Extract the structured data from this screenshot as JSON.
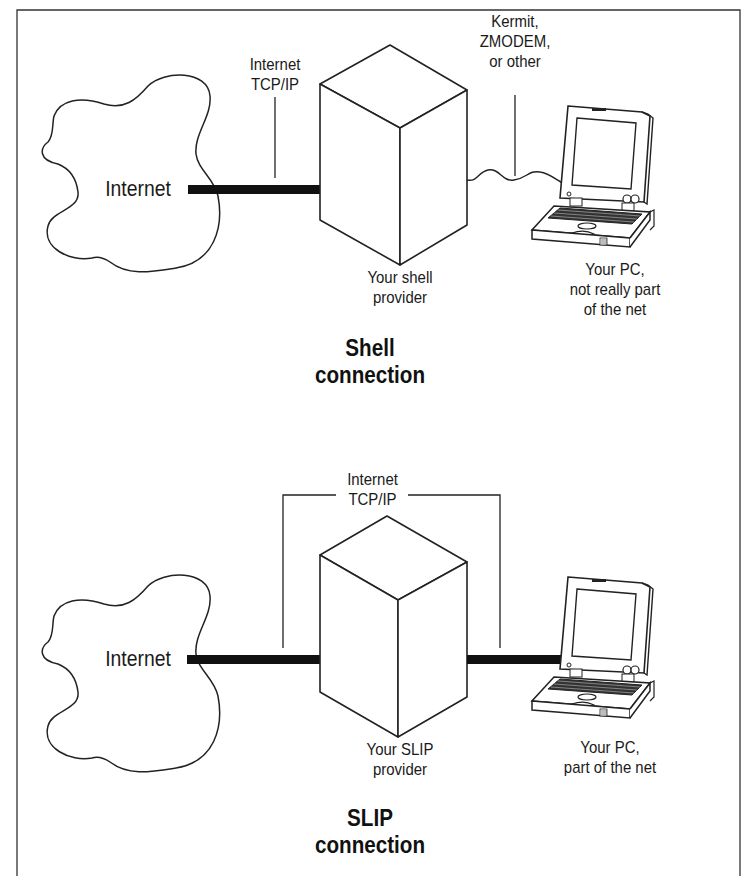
{
  "colors": {
    "ink": "#1a1a1a",
    "line": "#222222",
    "thick_link": "#111111",
    "background": "#ffffff"
  },
  "shell": {
    "internet_label": "Internet",
    "tcpip_label": "Internet\nTCP/IP",
    "protocol_label": "Kermit,\nZMODEM,\nor other",
    "provider_label": "Your shell\nprovider",
    "pc_label": "Your PC,\nnot really part\nof the net",
    "title": "Shell\nconnection"
  },
  "slip": {
    "internet_label": "Internet",
    "tcpip_label": "Internet\nTCP/IP",
    "provider_label": "Your SLIP\nprovider",
    "pc_label": "Your PC,\npart of the net",
    "title": "SLIP\nconnection"
  },
  "icons": {
    "cloud": "internet-cloud-icon",
    "server": "server-cube-icon",
    "laptop": "laptop-icon"
  }
}
